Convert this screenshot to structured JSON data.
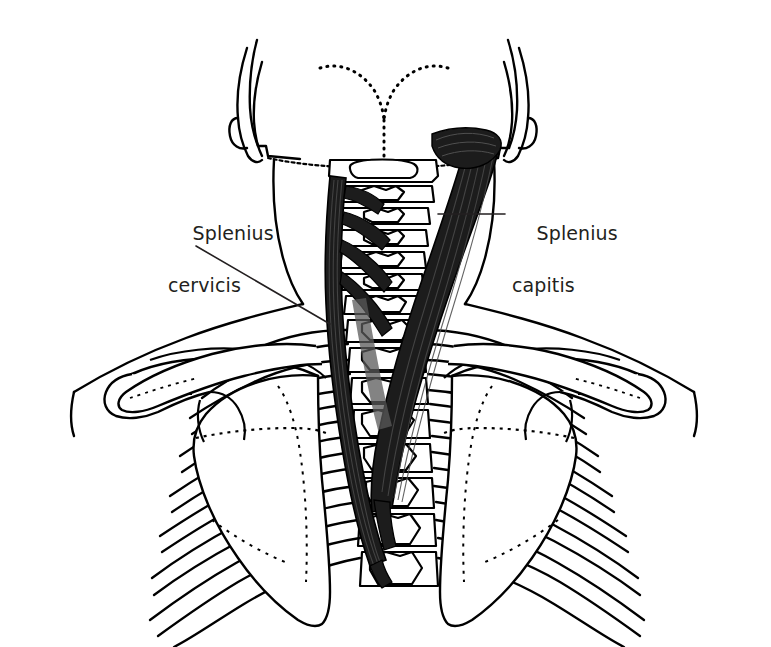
{
  "figure": {
    "view": "posterior",
    "background_color": "#ffffff",
    "ink_color": "#000000",
    "label_color": "#231f20",
    "muscle_fill": "#1a1a1a",
    "muscle_shade": "#5a5a5a"
  },
  "labels": {
    "cervicis": {
      "line1": "Splenius",
      "line2": "cervicis",
      "leader": "diagonal-down-right"
    },
    "capitis": {
      "line1": "Splenius",
      "line2": "capitis",
      "leader": "horizontal-left"
    }
  },
  "structures": [
    {
      "name": "occipital-bone",
      "kind": "bone"
    },
    {
      "name": "nuchal-lines",
      "kind": "dotted-landmark"
    },
    {
      "name": "left-ear",
      "kind": "soft-tissue"
    },
    {
      "name": "right-ear",
      "kind": "soft-tissue"
    },
    {
      "name": "cervical-vertebrae",
      "kind": "bone"
    },
    {
      "name": "thoracic-vertebrae",
      "kind": "bone"
    },
    {
      "name": "left-ribs",
      "kind": "bone"
    },
    {
      "name": "right-ribs",
      "kind": "bone"
    },
    {
      "name": "left-scapula",
      "kind": "bone"
    },
    {
      "name": "right-scapula",
      "kind": "bone"
    },
    {
      "name": "left-clavicle",
      "kind": "bone"
    },
    {
      "name": "right-clavicle",
      "kind": "bone"
    },
    {
      "name": "neck-contour",
      "kind": "outline"
    },
    {
      "name": "shoulder-contour",
      "kind": "outline"
    },
    {
      "name": "splenius-cervicis-muscle",
      "kind": "muscle"
    },
    {
      "name": "splenius-capitis-muscle",
      "kind": "muscle"
    }
  ]
}
